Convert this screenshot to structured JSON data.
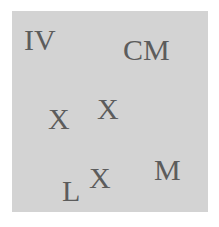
{
  "background_color": "#ffffff",
  "panel_color": "#d3d3d3",
  "text_color": "#5c5c5c",
  "tokens": [
    {
      "text": "IV",
      "x": 24,
      "y": 25
    },
    {
      "text": "CM",
      "x": 123,
      "y": 35
    },
    {
      "text": "X",
      "x": 48,
      "y": 104
    },
    {
      "text": "X",
      "x": 97,
      "y": 94
    },
    {
      "text": "L",
      "x": 62,
      "y": 176
    },
    {
      "text": "X",
      "x": 89,
      "y": 163
    },
    {
      "text": "M",
      "x": 154,
      "y": 155
    }
  ]
}
